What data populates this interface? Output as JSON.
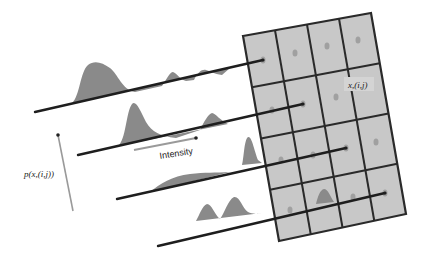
{
  "figure": {
    "colors": {
      "background": "#ffffff",
      "grid_fill": "#c8c8c8",
      "grid_stroke": "#2a2a2a",
      "distribution_fill": "#8a8a8a",
      "axis_line": "#1e1e1e",
      "arrow_line": "#9a9a9a",
      "cell_dot": "#a0a0a0"
    },
    "grid": {
      "rows": 4,
      "cols": 4,
      "corners": {
        "top_left": [
          243,
          36
        ],
        "top_right": [
          371,
          13
        ],
        "bottom_right": [
          406,
          214
        ],
        "bottom_left": [
          279,
          241
        ]
      }
    },
    "labels": {
      "pixel_label": "x,(i,j)",
      "probability_label": "p(x,(i,j))",
      "intensity_label": "Intensity"
    },
    "intensity_lines": [
      {
        "start": [
          35,
          112
        ],
        "end": [
          263,
          60
        ]
      },
      {
        "start": [
          78,
          155
        ],
        "end": [
          303,
          104
        ]
      },
      {
        "start": [
          117,
          199
        ],
        "end": [
          346,
          148
        ]
      },
      {
        "start": [
          158,
          246
        ],
        "end": [
          385,
          193
        ]
      }
    ]
  }
}
